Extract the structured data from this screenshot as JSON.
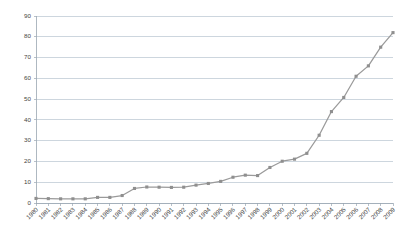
{
  "chart_data": {
    "type": "line",
    "title": "",
    "subtitle": "",
    "xlabel": "",
    "ylabel": "",
    "ylim": [
      0,
      90
    ],
    "yticks": [
      0,
      10,
      20,
      30,
      40,
      50,
      60,
      70,
      80,
      90
    ],
    "grid": true,
    "legend": false,
    "legend_position": "none",
    "annotations": [],
    "line_color": "#9a9a9a",
    "marker_color": "#8f8f8f",
    "gridline_color": "#b8c4d0",
    "axis_color": "#9aa6b2",
    "background_color": "#ffffff",
    "categories": [
      "1980",
      "1981",
      "1982",
      "1983",
      "1984",
      "1985",
      "1986",
      "1987",
      "1988",
      "1989",
      "1990",
      "1991",
      "1992",
      "1993",
      "1994",
      "1995",
      "1996",
      "1997",
      "1998",
      "1999",
      "2000",
      "2001",
      "2002",
      "2003",
      "2004",
      "2005",
      "2006",
      "2007",
      "2008",
      "2009"
    ],
    "values": [
      2.2,
      2.1,
      2.0,
      2.0,
      2.0,
      2.7,
      2.7,
      3.6,
      7.0,
      7.7,
      7.6,
      7.5,
      7.6,
      8.6,
      9.4,
      10.4,
      12.4,
      13.4,
      13.2,
      17.1,
      20.1,
      21.1,
      23.9,
      32.6,
      44.0,
      50.8,
      61.0,
      66.0,
      75.0,
      82.0
    ],
    "series": [
      {
        "name": "Series 1",
        "values": [
          2.2,
          2.1,
          2.0,
          2.0,
          2.0,
          2.7,
          2.7,
          3.6,
          7.0,
          7.7,
          7.6,
          7.5,
          7.6,
          8.6,
          9.4,
          10.4,
          12.4,
          13.4,
          13.2,
          17.1,
          20.1,
          21.1,
          23.9,
          32.6,
          44.0,
          50.8,
          61.0,
          66.0,
          75.0,
          82.0
        ]
      }
    ]
  }
}
